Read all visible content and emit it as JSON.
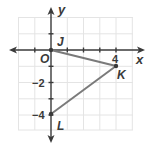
{
  "diagram": {
    "type": "coordinate-plane",
    "axes": {
      "x_label": "x",
      "y_label": "y",
      "origin_label": "O",
      "x_ticks_labeled": [
        "4"
      ],
      "y_ticks_labeled": [
        "−2",
        "−4"
      ],
      "grid_unit": 1
    },
    "points": [
      {
        "name": "J",
        "x": 0,
        "y": 0
      },
      {
        "name": "K",
        "x": 4,
        "y": -1
      },
      {
        "name": "L",
        "x": 0,
        "y": -4
      }
    ],
    "segments": [
      {
        "from": "J",
        "to": "K"
      },
      {
        "from": "K",
        "to": "L"
      }
    ],
    "colors": {
      "grid": "#e4e4e4",
      "axis": "#3a3a3a",
      "segment": "#7a7a7a",
      "text": "#3a3a3a"
    }
  },
  "labels": {
    "x_axis": "x",
    "y_axis": "y",
    "origin": "O",
    "tick_x4": "4",
    "tick_y_neg2": "−2",
    "tick_y_neg4": "−4",
    "point_j": "J",
    "point_k": "K",
    "point_l": "L"
  }
}
